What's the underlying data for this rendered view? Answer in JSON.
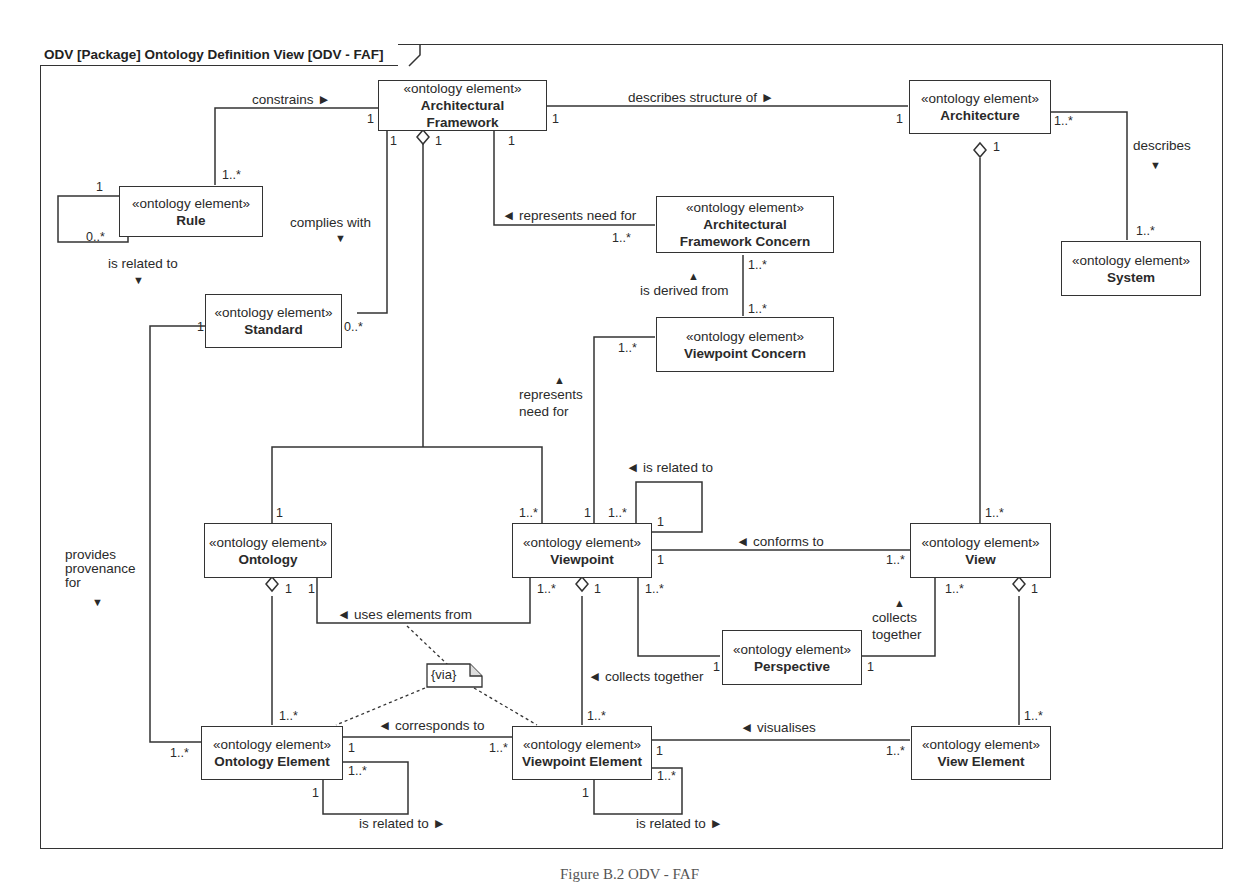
{
  "frame": {
    "title": "ODV [Package] Ontology Definition View [ODV - FAF]"
  },
  "stereotype": "«ontology element»",
  "blocks": {
    "architectural_framework": {
      "name_line1": "Architectural",
      "name_line2": "Framework"
    },
    "architecture": {
      "name": "Architecture"
    },
    "rule": {
      "name": "Rule"
    },
    "af_concern": {
      "name_line1": "Architectural",
      "name_line2": "Framework Concern"
    },
    "system": {
      "name": "System"
    },
    "standard": {
      "name": "Standard"
    },
    "viewpoint_concern": {
      "name": "Viewpoint Concern"
    },
    "ontology": {
      "name": "Ontology"
    },
    "viewpoint": {
      "name": "Viewpoint"
    },
    "view": {
      "name": "View"
    },
    "perspective": {
      "name": "Perspective"
    },
    "ontology_element": {
      "name": "Ontology Element"
    },
    "viewpoint_element": {
      "name": "Viewpoint Element"
    },
    "view_element": {
      "name": "View Element"
    }
  },
  "relations": {
    "constrains": "constrains ►",
    "describes_structure_of": "describes structure of ►",
    "describes": "describes",
    "describes_arrow": "▼",
    "represents_need_for_af": "◄ represents need for",
    "complies_with": "complies with",
    "complies_with_arrow": "▼",
    "rule_is_related_to": "is related to",
    "rule_is_related_to_arrow": "▼",
    "is_derived_from": "is derived from",
    "is_derived_from_arrow": "▲",
    "represents_need_for_vp_line1": "represents",
    "represents_need_for_vp_line2": "need for",
    "represents_need_for_vp_arrow": "▲",
    "vp_is_related_to": "◄ is related to",
    "conforms_to": "◄ conforms to",
    "provides_provenance_line1": "provides",
    "provides_provenance_line2": "provenance",
    "provides_provenance_line3": "for",
    "provides_provenance_arrow": "▼",
    "uses_elements_from": "◄ uses elements from",
    "collects_together_persp_line1": "collects",
    "collects_together_persp_line2": "together",
    "collects_together_persp_arrow": "▲",
    "collects_together_vpe": "◄ collects together",
    "corresponds_to": "◄ corresponds to",
    "visualises": "◄ visualises",
    "oe_is_related_to": "is related to ►",
    "vpe_is_related_to": "is related to ►"
  },
  "note": {
    "text": "{via}"
  },
  "multiplicities": {
    "one": "1",
    "one_many": "1..*",
    "zero_many": "0..*"
  },
  "caption": "Figure B.2   ODV - FAF"
}
